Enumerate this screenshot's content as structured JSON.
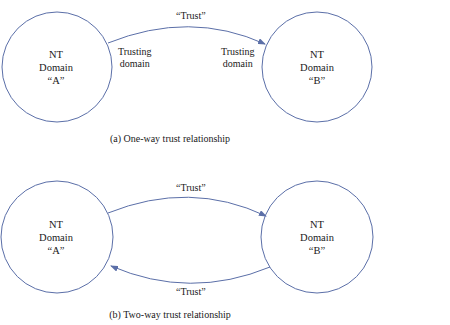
{
  "stroke_color": "#5b6fa8",
  "panels": [
    {
      "id": "a",
      "caption": "(a) One-way trust relationship",
      "nodes": [
        {
          "line1": "NT",
          "line2": "Domain",
          "line3": "“A”"
        },
        {
          "line1": "NT",
          "line2": "Domain",
          "line3": "“B”"
        }
      ],
      "edges": [
        {
          "from": "A",
          "to": "B",
          "label": "“Trust”"
        }
      ],
      "annotations": [
        {
          "line1": "Trusting",
          "line2": "domain"
        },
        {
          "line1": "Trusting",
          "line2": "domain"
        }
      ]
    },
    {
      "id": "b",
      "caption": "(b) Two-way trust relationship",
      "nodes": [
        {
          "line1": "NT",
          "line2": "Domain",
          "line3": "“A”"
        },
        {
          "line1": "NT",
          "line2": "Domain",
          "line3": "“B”"
        }
      ],
      "edges": [
        {
          "from": "A",
          "to": "B",
          "label": "“Trust”"
        },
        {
          "from": "B",
          "to": "A",
          "label": "“Trust”"
        }
      ]
    }
  ]
}
